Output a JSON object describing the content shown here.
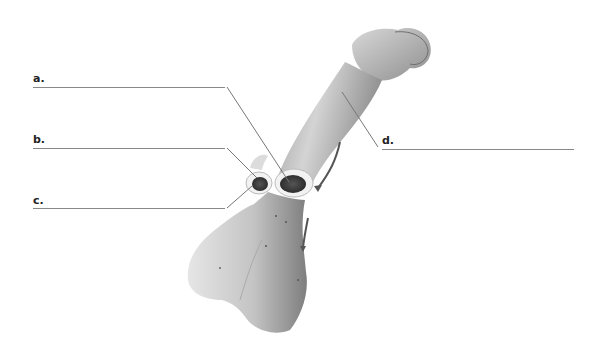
{
  "diagram": {
    "type": "anatomical-labeling-worksheet",
    "labels": [
      {
        "id": "a",
        "text": "a.",
        "answer": ""
      },
      {
        "id": "b",
        "text": "b.",
        "answer": ""
      },
      {
        "id": "c",
        "text": "c.",
        "answer": ""
      },
      {
        "id": "d",
        "text": "d.",
        "answer": ""
      }
    ]
  },
  "colors": {
    "background": "#ffffff",
    "line": "#888888",
    "bone_light": "#e8e8e8",
    "bone_mid": "#bdbdbd",
    "bone_dark": "#8a8a8a",
    "marrow": "#3a3a3a",
    "arrow": "#555555"
  }
}
